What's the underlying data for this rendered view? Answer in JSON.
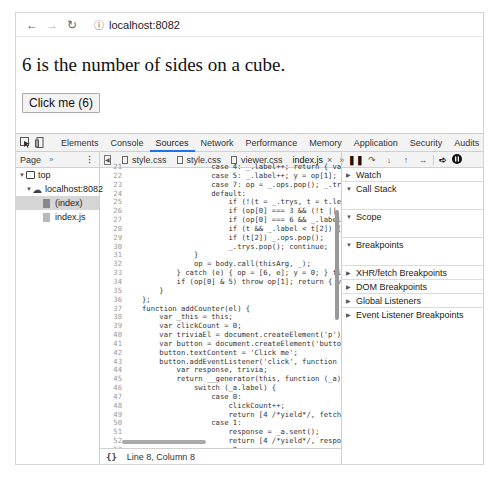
{
  "browser": {
    "nav": {
      "back": "←",
      "forward": "→",
      "reload": "C"
    },
    "info_icon": "ⓘ",
    "url": "localhost:8082"
  },
  "page": {
    "trivia_text": "6 is the number of sides on a cube.",
    "button_label": "Click me (6)"
  },
  "devtools": {
    "tabs": [
      {
        "label": "Elements",
        "active": false
      },
      {
        "label": "Console",
        "active": false
      },
      {
        "label": "Sources",
        "active": true
      },
      {
        "label": "Network",
        "active": false
      },
      {
        "label": "Performance",
        "active": false
      },
      {
        "label": "Memory",
        "active": false
      },
      {
        "label": "Application",
        "active": false
      },
      {
        "label": "Security",
        "active": false
      },
      {
        "label": "Audits",
        "active": false
      },
      {
        "label": "Adblock Plus",
        "active": false
      }
    ],
    "navigator": {
      "header": "Page",
      "more": "»",
      "kebab": "⋮",
      "tree": [
        {
          "label": "top",
          "type": "frame"
        },
        {
          "label": "localhost:8082",
          "type": "origin"
        },
        {
          "label": "(index)",
          "type": "file",
          "selected": true
        },
        {
          "label": "index.js",
          "type": "file",
          "selected": false
        }
      ]
    },
    "editor": {
      "file_tabs": [
        {
          "label": "style.css"
        },
        {
          "label": "style.css"
        },
        {
          "label": "viewer.css"
        },
        {
          "label": "index.js",
          "active": true,
          "close": "×"
        }
      ],
      "more": "»",
      "lines": [
        {
          "n": "21",
          "t": "                case 4: _.label++; return { value: op[1], done: false };"
        },
        {
          "n": "22",
          "t": "                case 5: _.label++; y = op[1]; op = [0]; continue;"
        },
        {
          "n": "23",
          "t": "                case 7: op = _.ops.pop(); _.trys.pop(); continue;"
        },
        {
          "n": "24",
          "t": "                default:"
        },
        {
          "n": "25",
          "t": "                    if (!(t = _.trys, t = t.length > 0 && t[t.length - 1])"
        },
        {
          "n": "26",
          "t": "                    if (op[0] === 3 && (!t || (op[1] > t[0] && op[1] < t[3]"
        },
        {
          "n": "27",
          "t": "                    if (op[0] === 6 && _.label < t[1]) { _.label = t[1];"
        },
        {
          "n": "28",
          "t": "                    if (t && _.label < t[2]) { _.label = t[2]; _.ops.push"
        },
        {
          "n": "29",
          "t": "                    if (t[2]) _.ops.pop();"
        },
        {
          "n": "30",
          "t": "                    _.trys.pop(); continue;"
        },
        {
          "n": "31",
          "t": "            }"
        },
        {
          "n": "32",
          "t": "            op = body.call(thisArg, _);"
        },
        {
          "n": "33",
          "t": "        } catch (e) { op = [6, e]; y = 0; } finally { f = t = 0; }"
        },
        {
          "n": "34",
          "t": "        if (op[0] & 5) throw op[1]; return { value: op[0] ? op[1] : void 0"
        },
        {
          "n": "35",
          "t": "    }"
        },
        {
          "n": "36",
          "t": "};"
        },
        {
          "n": "37",
          "t": "function addCounter(el) {"
        },
        {
          "n": "38",
          "t": "    var _this = this;"
        },
        {
          "n": "39",
          "t": "    var clickCount = 0;"
        },
        {
          "n": "40",
          "t": "    var triviaEl = document.createElement('p');"
        },
        {
          "n": "41",
          "t": "    var button = document.createElement('button');"
        },
        {
          "n": "42",
          "t": "    button.textContent = 'Click me';"
        },
        {
          "n": "43",
          "t": "    button.addEventListener('click', function () { return __awaiter"
        },
        {
          "n": "44",
          "t": "        var response, trivia;"
        },
        {
          "n": "45",
          "t": "        return __generator(this, function (_a) {"
        },
        {
          "n": "46",
          "t": "            switch (_a.label) {"
        },
        {
          "n": "47",
          "t": "                case 0:"
        },
        {
          "n": "48",
          "t": "                    clickCount++;"
        },
        {
          "n": "49",
          "t": "                    return [4 /*yield*/, fetch(\"http://numbersapi.com"
        },
        {
          "n": "50",
          "t": "                case 1:"
        },
        {
          "n": "51",
          "t": "                    response = _a.sent();"
        },
        {
          "n": "52",
          "t": "                    return [4 /*yield*/, response.text()];"
        },
        {
          "n": "53",
          "t": "                case 2:"
        },
        {
          "n": "54",
          "t": "                    trivia = _a.sent();"
        },
        {
          "n": "55",
          "t": "                    triviaEl.textContent = trivia;"
        },
        {
          "n": "56",
          "t": "                    button.textContent = \"Click me (\" + clickCount"
        },
        {
          "n": "57",
          "t": "                    return [2 /*return*/];"
        },
        {
          "n": "58",
          "t": "            }"
        },
        {
          "n": "59",
          "t": "        });"
        },
        {
          "n": "60",
          "t": ""
        }
      ],
      "status": {
        "braces": "{}",
        "position": "Line 8, Column 8"
      }
    },
    "debugger": {
      "toolbar": [
        "pause",
        "step-over",
        "step-into",
        "step-out",
        "step",
        "deactivate-breakpoints",
        "pause-on-exceptions"
      ],
      "sections": [
        {
          "label": "Watch",
          "expanded": false
        },
        {
          "label": "Call Stack",
          "expanded": true
        },
        {
          "label": "Scope",
          "expanded": true
        },
        {
          "label": "Breakpoints",
          "expanded": true
        },
        {
          "label": "XHR/fetch Breakpoints",
          "expanded": false
        },
        {
          "label": "DOM Breakpoints",
          "expanded": false
        },
        {
          "label": "Global Listeners",
          "expanded": false
        },
        {
          "label": "Event Listener Breakpoints",
          "expanded": false
        }
      ]
    }
  }
}
